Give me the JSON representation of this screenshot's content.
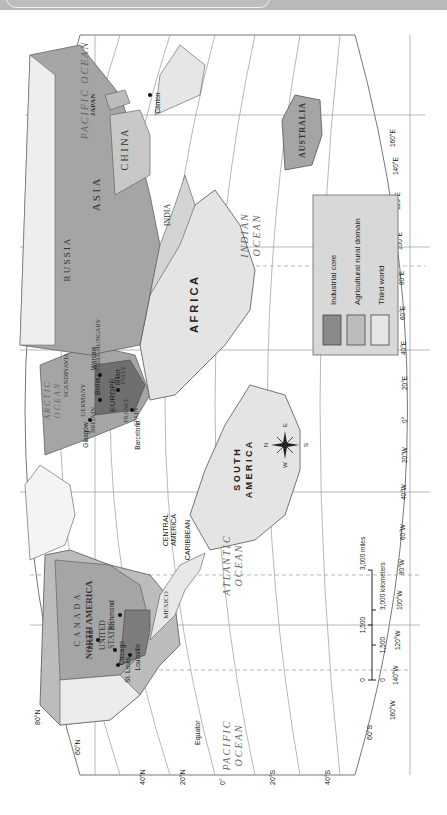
{
  "map": {
    "orientation": "rotated 90° counter-clockwise (north to the left)",
    "regions": {
      "continents": [
        "NORTH AMERICA",
        "SOUTH AMERICA",
        "EUROPE",
        "AFRICA",
        "ASIA",
        "AUSTRALIA"
      ],
      "countries": [
        "CANADA",
        "UNITED STATES",
        "MEXICO",
        "CENTRAL AMERICA",
        "CARIBBEAN",
        "RUSSIA",
        "CHINA",
        "INDIA",
        "JAPAN",
        "GERMANY",
        "BRITAIN",
        "FRANCE",
        "SPAIN",
        "ITALY",
        "SCANDINAVIA",
        "AUSTRIA-HUNGARY"
      ],
      "oceans": {
        "arctic": [
          "ARCTIC",
          "OCEAN"
        ],
        "atlantic": [
          "ATLANTIC",
          "OCEAN"
        ],
        "pacific_west": [
          "PACIFIC",
          "OCEAN"
        ],
        "pacific_east": "PACIFIC OCEAN",
        "indian": [
          "INDIAN",
          "OCEAN"
        ]
      }
    },
    "cities": [
      "Toronto",
      "Chicago",
      "Richmond",
      "St. Louis",
      "Louisville",
      "Glasgow",
      "Berlin",
      "Warsaw",
      "Milan",
      "Barcelona",
      "Canton"
    ],
    "labels": {
      "canada": "C A N A D A",
      "north_america": "NORTH AMERICA",
      "united_states": [
        "UNITED",
        "STATES"
      ],
      "mexico": "MEXICO",
      "central_america": [
        "CENTRAL",
        "AMERICA"
      ],
      "caribbean": "CARIBBEAN",
      "south_america": [
        "S O U T H",
        "A M E R I C A"
      ],
      "africa": "A F R I C A",
      "europe": "EUROPE",
      "russia": "R U S S I A",
      "asia": "A S I A",
      "china": "C H I N A",
      "india": "INDIA",
      "japan": "JAPAN",
      "australia": "AUSTRALIA",
      "germany": "GERMANY",
      "britain": "BRITAIN",
      "france": "FRANCE",
      "spain": "SPAIN",
      "italy": "ITALY",
      "scandinavia": "SCANDINAVIA",
      "austria_hungary": "AUSTRIA-HUNGARY",
      "st_louis": [
        "St.",
        "Louis"
      ],
      "equator": "Equator"
    },
    "latitude_ticks": [
      "60°N",
      "40°N",
      "20°N",
      "0°",
      "20°S",
      "40°S",
      "60°S",
      "80°N"
    ],
    "longitude_ticks": [
      "160°W",
      "140°W",
      "120°W",
      "100°W",
      "80°W",
      "60°W",
      "40°W",
      "20°W",
      "0°",
      "20°E",
      "40°E",
      "60°E",
      "80°E",
      "100°E",
      "120°E",
      "140°E",
      "160°E"
    ],
    "compass": {
      "n": "N",
      "s": "S",
      "e": "E",
      "w": "W"
    },
    "scale": {
      "miles": [
        "0",
        "1,500",
        "3,000 miles"
      ],
      "kilometers": [
        "0",
        "1,500",
        "3,000 kilometers"
      ]
    }
  },
  "legend": {
    "items": [
      {
        "label": "Industrial core",
        "color": "#8a8a8a"
      },
      {
        "label": "Agricultural rural domain",
        "color": "#bcbcbc"
      },
      {
        "label": "Third world",
        "color": "#e6e6e6"
      }
    ]
  },
  "colors": {
    "industrial_core": "#8a8a8a",
    "agricultural": "#bcbcbc",
    "third_world": "#e6e6e6",
    "water": "#ffffff",
    "header": "#b9b9b9"
  }
}
